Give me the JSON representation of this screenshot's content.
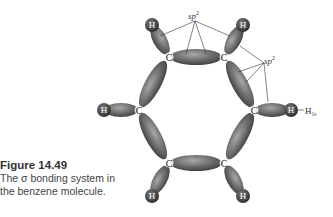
{
  "caption": {
    "title": "Figure 14.49",
    "line1": "The σ bonding system in",
    "line2": "the benzene molecule."
  },
  "diagram": {
    "labels": {
      "sp2_top": "sp",
      "sp2_top_sup": "2",
      "sp2_right": "sp",
      "sp2_right_sup": "2",
      "h1s": "H",
      "h1s_sub": "1s"
    },
    "carbon_label": "C",
    "hydrogen_label": "H",
    "colors": {
      "lobe": "#5a5a5a",
      "lobe_light": "#9a9a9a",
      "h_atom": "#3a3a3a",
      "line": "#333333"
    }
  }
}
